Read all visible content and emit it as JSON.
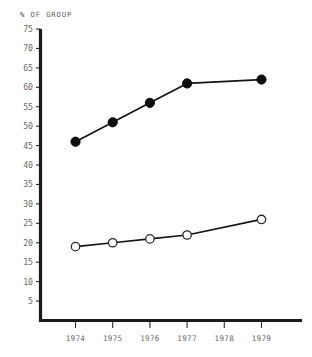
{
  "chart_data": {
    "type": "line",
    "title": "% OF GROUP",
    "xlabel": "",
    "ylabel": "",
    "ylim": [
      0,
      75
    ],
    "yticks": [
      75,
      70,
      65,
      60,
      55,
      50,
      45,
      40,
      35,
      30,
      25,
      20,
      15,
      10,
      5
    ],
    "categories": [
      "1974",
      "1975",
      "1976",
      "1977",
      "1978",
      "1979"
    ],
    "grid": false,
    "legend": "none",
    "series": [
      {
        "name": "filled-series",
        "marker": "filled-circle",
        "x": [
          "1974",
          "1975",
          "1976",
          "1977",
          "1979"
        ],
        "values": [
          46,
          51,
          56,
          61,
          62
        ]
      },
      {
        "name": "open-series",
        "marker": "open-circle",
        "x": [
          "1974",
          "1975",
          "1976",
          "1977",
          "1979"
        ],
        "values": [
          19,
          20,
          21,
          22,
          26
        ]
      }
    ],
    "colors": {
      "axis": "#1a1a1a",
      "line": "#151515",
      "filled_marker": "#0d0d0d",
      "open_marker_fill": "#ffffff",
      "text": "#6a6a6a",
      "background": "#ffffff"
    }
  },
  "axis_title_text": "% OF GROUP"
}
